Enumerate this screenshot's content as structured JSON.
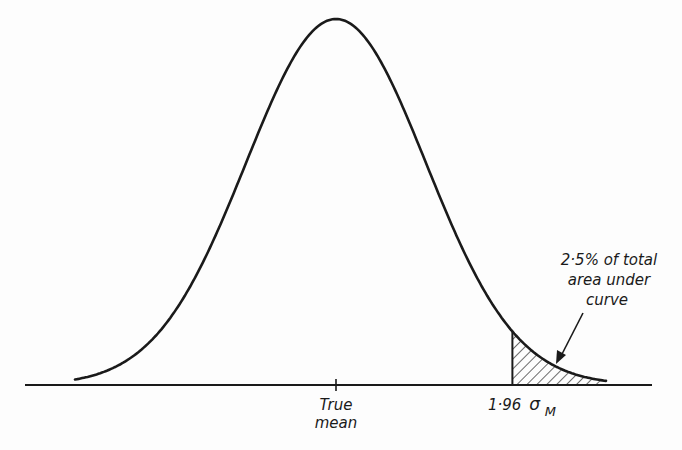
{
  "chart_data": {
    "type": "area",
    "title": "",
    "distribution": {
      "kind": "normal",
      "mean": 0,
      "sd": 1
    },
    "x_range_sd": [
      -2.9,
      3.0
    ],
    "shaded_region": {
      "from_sd": 1.96,
      "to_sd": 3.0,
      "pattern": "hatched",
      "area_percent": 2.5
    },
    "ticks": [
      {
        "at_sd": 0,
        "label_lines": [
          "True",
          "mean"
        ]
      },
      {
        "at_sd": 1.96,
        "label": "1·96",
        "symbol": "σ",
        "subscript": "M"
      }
    ],
    "annotation": {
      "lines": [
        "2·5% of total",
        "area under",
        "curve"
      ],
      "points_to": "shaded_region"
    },
    "xlabel": "",
    "ylabel": "",
    "grid": false,
    "legend": "none"
  },
  "colors": {
    "ink": "#1a1a1a",
    "background": "#fdfdfd"
  }
}
